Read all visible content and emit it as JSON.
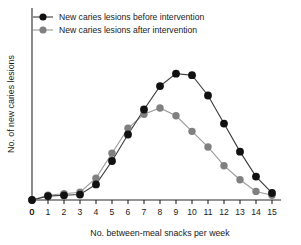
{
  "chart_data": {
    "type": "line",
    "title": "",
    "subtitle": "",
    "xlabel": "No. between-meal snacks per week",
    "ylabel": "No. of new caries lesions",
    "x": [
      0,
      1,
      2,
      3,
      4,
      5,
      6,
      7,
      8,
      9,
      10,
      11,
      12,
      13,
      14,
      15
    ],
    "xticklabels": [
      "0",
      "1",
      "2",
      "3",
      "4",
      "5",
      "6",
      "7",
      "8",
      "9",
      "10",
      "11",
      "12",
      "13",
      "14",
      "15"
    ],
    "yticklabels": [
      "0"
    ],
    "xlim": [
      0,
      15
    ],
    "ylim": [
      0,
      10
    ],
    "grid": false,
    "legend_position": "top-left",
    "series": [
      {
        "name": "New caries lesions before intervention",
        "color": "#111111",
        "marker": "circle",
        "values": [
          0.0,
          0.25,
          0.3,
          0.35,
          1.0,
          2.5,
          4.2,
          5.8,
          7.3,
          8.1,
          8.0,
          6.7,
          4.9,
          3.1,
          1.5,
          0.45
        ]
      },
      {
        "name": "New caries lesions after intervention",
        "color": "#808080",
        "marker": "circle",
        "values": [
          0.0,
          0.3,
          0.4,
          0.5,
          1.4,
          3.0,
          4.6,
          5.5,
          5.9,
          5.4,
          4.4,
          3.4,
          2.2,
          1.3,
          0.55,
          0.3
        ]
      }
    ]
  },
  "legend": {
    "items": [
      {
        "label": "New caries lesions before intervention",
        "color": "#111111"
      },
      {
        "label": "New caries lesions after intervention",
        "color": "#808080"
      }
    ]
  },
  "axes": {
    "x_title": "No. between-meal snacks per week",
    "y_title": "No. of new caries lesions",
    "y_zero_label": "0"
  }
}
